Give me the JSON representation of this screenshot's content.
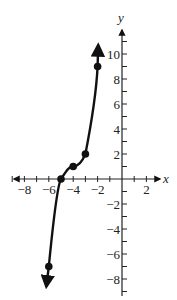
{
  "chart_data": {
    "type": "line",
    "title": "",
    "xlabel": "x",
    "ylabel": "y",
    "xlim": [
      -9,
      3
    ],
    "ylim": [
      -9,
      11
    ],
    "grid": false,
    "x_ticks": [
      -8,
      -6,
      -4,
      -2,
      2
    ],
    "y_ticks": [
      -8,
      -6,
      -4,
      -2,
      2,
      4,
      6,
      8,
      10
    ],
    "x_tick_labels": [
      "−8",
      "−6",
      "−4",
      "−2",
      "2"
    ],
    "y_tick_labels": [
      "−8",
      "−6",
      "−4",
      "−2",
      "2",
      "4",
      "6",
      "8",
      "10"
    ],
    "points": [
      {
        "x": -6,
        "y": -7
      },
      {
        "x": -5,
        "y": 0
      },
      {
        "x": -4,
        "y": 1
      },
      {
        "x": -3,
        "y": 2
      },
      {
        "x": -2,
        "y": 9
      }
    ],
    "curve_ends": "arrows at both ends (down past (-6,-7), up past (-2,9))",
    "line_color": "#111111"
  }
}
